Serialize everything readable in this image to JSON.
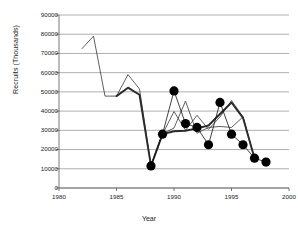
{
  "chart_data": {
    "type": "line",
    "title": "",
    "xlabel": "Year",
    "ylabel": "Recruits (Thousands)",
    "xlim": [
      1980,
      2000
    ],
    "ylim": [
      0,
      90000
    ],
    "xticks": [
      1980,
      1985,
      1990,
      1995,
      2000
    ],
    "yticks": [
      0,
      10000,
      20000,
      30000,
      40000,
      50000,
      60000,
      70000,
      80000,
      90000
    ],
    "grid": "horizontal",
    "legend": "none",
    "series": [
      {
        "name": "thin-line-1",
        "style": "thin",
        "x": [
          1982,
          1983,
          1984,
          1985,
          1986,
          1987,
          1988,
          1989,
          1990,
          1991,
          1992,
          1993,
          1994,
          1995,
          1996,
          1997
        ],
        "values": [
          72500,
          79000,
          47800,
          47800,
          59000,
          51500,
          11800,
          28000,
          39800,
          30000,
          37800,
          30500,
          37000,
          45500,
          37000,
          15500
        ]
      },
      {
        "name": "thin-line-2",
        "style": "thin",
        "x": [
          1988,
          1989,
          1990,
          1991,
          1992,
          1993,
          1994,
          1995,
          1996,
          1997
        ],
        "values": [
          11800,
          28200,
          31200,
          45200,
          28500,
          31500,
          32000,
          31500,
          37000,
          15500
        ]
      },
      {
        "name": "bold-line",
        "style": "bold",
        "x": [
          1985,
          1986,
          1987,
          1988,
          1989,
          1990,
          1991,
          1992,
          1993,
          1994,
          1995,
          1996,
          1997
        ],
        "values": [
          47800,
          52200,
          48500,
          11500,
          28000,
          29500,
          29800,
          31000,
          32500,
          38500,
          44500,
          36500,
          15500
        ]
      },
      {
        "name": "marker-series",
        "style": "markers",
        "x": [
          1988,
          1989,
          1990,
          1991,
          1992,
          1993,
          1994,
          1995,
          1996,
          1997,
          1998
        ],
        "values": [
          11500,
          28000,
          50500,
          33500,
          31500,
          22500,
          44500,
          28000,
          22500,
          15500,
          13500
        ]
      }
    ]
  }
}
